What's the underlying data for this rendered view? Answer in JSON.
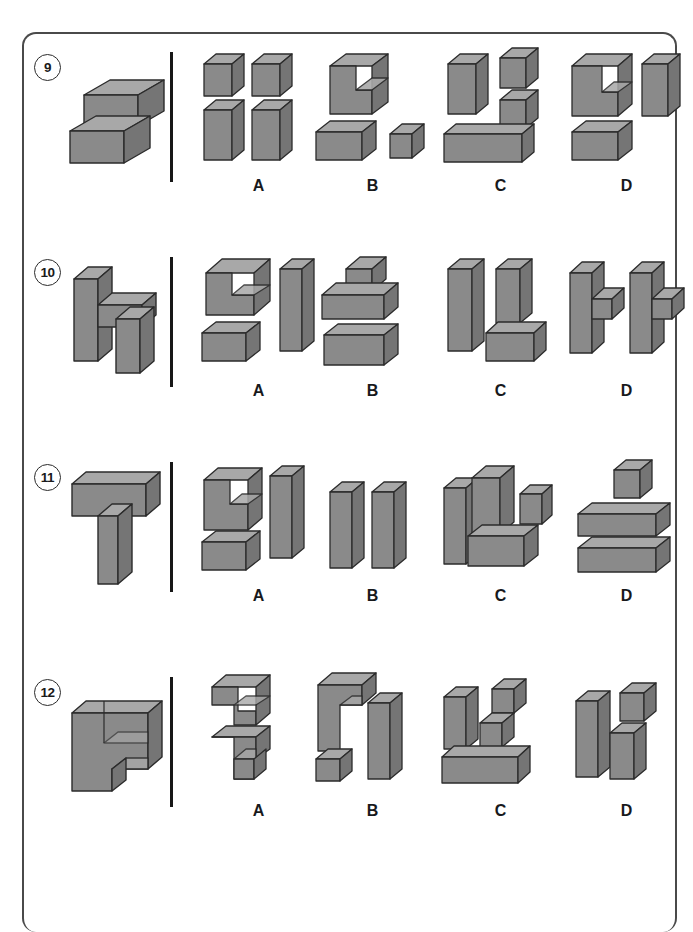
{
  "page": {
    "kind": "spatial-reasoning-worksheet",
    "frame_border_color": "#4a4a4a",
    "background": "#ffffff"
  },
  "block_colors": {
    "front": "#8a8a8a",
    "top": "#a8a8a8",
    "side": "#757575",
    "outline": "#2b2b2b"
  },
  "option_labels": [
    "A",
    "B",
    "C",
    "D"
  ],
  "questions": [
    {
      "number": "9",
      "stimulus_name": "s-shaped-block-figure",
      "options": [
        {
          "label": "A",
          "description": "four rectangular blocks in two rows"
        },
        {
          "label": "B",
          "description": "L-shaped block with flat block and small cube"
        },
        {
          "label": "C",
          "description": "tall block, two stacked small blocks, flat block"
        },
        {
          "label": "D",
          "description": "notched block, tall block and flat block"
        }
      ]
    },
    {
      "number": "10",
      "stimulus_name": "h-shaped-block-figure",
      "options": [
        {
          "label": "A",
          "description": "L-shaped block, flat block and tall block"
        },
        {
          "label": "B",
          "description": "plus-shaped block above flat block"
        },
        {
          "label": "C",
          "description": "two tall blocks and one flat block"
        },
        {
          "label": "D",
          "description": "two mirrored cross-shaped blocks"
        }
      ]
    },
    {
      "number": "11",
      "stimulus_name": "t-shaped-block-figure",
      "options": [
        {
          "label": "A",
          "description": "notched block, tall block and flat block"
        },
        {
          "label": "B",
          "description": "two tall slab blocks side by side"
        },
        {
          "label": "C",
          "description": "tall block, block, small cube and flat block"
        },
        {
          "label": "D",
          "description": "small cube above two stacked flat blocks"
        }
      ]
    },
    {
      "number": "12",
      "stimulus_name": "p-shaped-block-figure",
      "options": [
        {
          "label": "A",
          "description": "z-shaped block above t-shaped block"
        },
        {
          "label": "B",
          "description": "notched block, tall block and small cube"
        },
        {
          "label": "C",
          "description": "tall block, two small cubes and long flat block"
        },
        {
          "label": "D",
          "description": "tall block with two stacked cubes"
        }
      ]
    }
  ]
}
